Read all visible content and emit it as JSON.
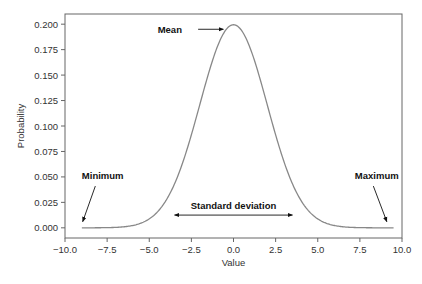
{
  "chart_data": {
    "type": "line",
    "title": "",
    "xlabel": "Value",
    "ylabel": "Probability",
    "xlim": [
      -10.0,
      10.0
    ],
    "ylim": [
      -0.01,
      0.21
    ],
    "grid": false,
    "legend": "none",
    "xticks": [
      -10.0,
      -7.5,
      -5.0,
      -2.5,
      0.0,
      2.5,
      5.0,
      7.5,
      10.0
    ],
    "xtick_labels": [
      "−10.0",
      "−7.5",
      "−5.0",
      "−2.5",
      "0.0",
      "2.5",
      "5.0",
      "7.5",
      "10.0"
    ],
    "yticks": [
      0.0,
      0.025,
      0.05,
      0.075,
      0.1,
      0.125,
      0.15,
      0.175,
      0.2
    ],
    "ytick_labels": [
      "0.000",
      "0.025",
      "0.050",
      "0.075",
      "0.100",
      "0.125",
      "0.150",
      "0.175",
      "0.200"
    ],
    "series": [
      {
        "name": "Normal distribution",
        "distribution": "normal",
        "mean": 0.0,
        "std": 2.0,
        "x_range": [
          -9.0,
          9.5
        ],
        "color": "#888888"
      }
    ],
    "annotations": [
      {
        "text": "Mean",
        "points_to": [
          0.0,
          0.199
        ],
        "direction": "right"
      },
      {
        "text": "Minimum",
        "points_to": [
          -9.0,
          0.0
        ],
        "direction": "down-left"
      },
      {
        "text": "Maximum",
        "points_to": [
          9.3,
          0.0
        ],
        "direction": "down-right"
      },
      {
        "text": "Standard deviation",
        "span": [
          -3.5,
          3.5
        ],
        "y": 0.0125,
        "direction": "both"
      }
    ]
  }
}
